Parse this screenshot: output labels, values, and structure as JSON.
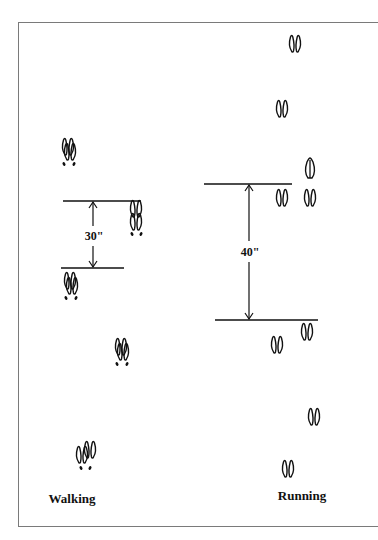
{
  "walking": {
    "title": "Walking",
    "measurement": "30\"",
    "measurement_inches": 30
  },
  "running": {
    "title": "Running",
    "measurement": "40\"",
    "measurement_inches": 40
  },
  "colors": {
    "ink": "#111111",
    "frame": "#7a7a7a"
  }
}
